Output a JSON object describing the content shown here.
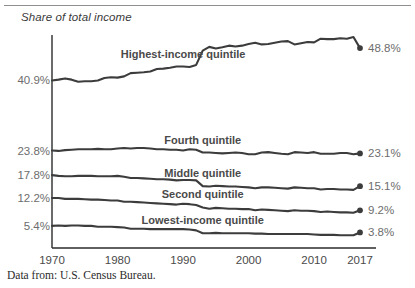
{
  "figure": {
    "axis_title": "Share of total income",
    "source_note": "Data from: U.S. Census Bureau."
  },
  "chart_data": {
    "type": "line",
    "title": "Share of total income",
    "xlabel": "",
    "ylabel": "Share of total income",
    "xlim": [
      1970,
      2017
    ],
    "ylim": [
      0,
      52
    ],
    "grid": false,
    "legend": "inline-labels",
    "xticks": [
      1970,
      1980,
      1990,
      2000,
      2010,
      2017
    ],
    "xticklabels": [
      "1970",
      "1980",
      "1990",
      "2000",
      "2010",
      "2017"
    ],
    "start_labels": [
      "40.9%",
      "23.8%",
      "17.8%",
      "12.2%",
      "5.4%"
    ],
    "end_labels": [
      "48.8%",
      "23.1%",
      "15.1%",
      "9.2%",
      "3.8%"
    ],
    "line_color": "#3c3c3c",
    "x": [
      1970,
      1971,
      1972,
      1973,
      1974,
      1975,
      1976,
      1977,
      1978,
      1979,
      1980,
      1981,
      1982,
      1983,
      1984,
      1985,
      1986,
      1987,
      1988,
      1989,
      1990,
      1991,
      1992,
      1993,
      1994,
      1995,
      1996,
      1997,
      1998,
      1999,
      2000,
      2001,
      2002,
      2003,
      2004,
      2005,
      2006,
      2007,
      2008,
      2009,
      2010,
      2011,
      2012,
      2013,
      2014,
      2015,
      2016,
      2017
    ],
    "series": [
      {
        "name": "Highest-income quintile",
        "start_value": 40.9,
        "end_value": 48.8,
        "label_x": 1990,
        "values": [
          40.9,
          41.1,
          41.4,
          41.1,
          40.6,
          40.7,
          40.7,
          40.9,
          41.5,
          41.7,
          41.6,
          41.9,
          42.7,
          42.8,
          42.9,
          43.1,
          43.7,
          43.8,
          44.0,
          44.3,
          44.3,
          44.2,
          44.7,
          48.2,
          49.1,
          48.7,
          49.0,
          49.4,
          49.2,
          49.4,
          49.8,
          50.1,
          49.7,
          49.8,
          50.1,
          50.4,
          50.5,
          49.7,
          50.0,
          50.3,
          50.2,
          51.1,
          51.0,
          51.0,
          51.2,
          51.1,
          51.5,
          48.8
        ]
      },
      {
        "name": "Fourth quintile",
        "start_value": 23.8,
        "end_value": 23.1,
        "label_x": 1993,
        "values": [
          23.8,
          23.7,
          23.9,
          24.0,
          24.1,
          24.1,
          24.1,
          24.2,
          24.1,
          24.1,
          24.3,
          24.4,
          24.3,
          24.4,
          24.4,
          24.3,
          24.1,
          24.1,
          24.0,
          24.0,
          23.8,
          24.1,
          24.0,
          23.3,
          23.3,
          23.2,
          23.1,
          23.2,
          23.3,
          23.2,
          22.9,
          22.9,
          23.3,
          23.4,
          23.2,
          23.0,
          22.9,
          23.4,
          23.3,
          23.2,
          23.4,
          23.0,
          23.0,
          23.0,
          23.2,
          23.2,
          22.9,
          23.1
        ]
      },
      {
        "name": "Middle quintile",
        "start_value": 17.8,
        "end_value": 15.1,
        "label_x": 1993,
        "values": [
          17.8,
          17.6,
          17.5,
          17.5,
          17.6,
          17.6,
          17.6,
          17.5,
          17.5,
          17.5,
          17.6,
          17.4,
          17.1,
          17.1,
          17.0,
          16.9,
          16.8,
          16.8,
          16.7,
          16.5,
          16.6,
          16.6,
          16.5,
          15.1,
          15.0,
          15.2,
          15.1,
          15.0,
          15.0,
          14.9,
          14.8,
          14.6,
          14.8,
          14.8,
          14.7,
          14.6,
          14.5,
          14.8,
          14.7,
          14.6,
          14.6,
          14.3,
          14.4,
          14.4,
          14.3,
          14.3,
          14.2,
          15.1
        ]
      },
      {
        "name": "Second quintile",
        "start_value": 12.2,
        "end_value": 9.2,
        "label_x": 1993,
        "values": [
          12.2,
          12.2,
          12.0,
          12.0,
          12.0,
          11.9,
          11.8,
          11.8,
          11.7,
          11.6,
          11.6,
          11.3,
          11.3,
          11.2,
          11.1,
          11.0,
          10.9,
          10.8,
          10.7,
          10.6,
          10.8,
          10.7,
          10.5,
          9.9,
          9.6,
          9.8,
          9.7,
          9.6,
          9.6,
          9.5,
          9.5,
          9.2,
          9.4,
          9.3,
          9.2,
          9.1,
          9.0,
          9.2,
          9.1,
          9.1,
          9.0,
          8.8,
          8.9,
          8.8,
          8.7,
          8.7,
          8.6,
          9.2
        ]
      },
      {
        "name": "Lowest-income quintile",
        "start_value": 5.4,
        "end_value": 3.8,
        "label_x": 1993,
        "values": [
          5.4,
          5.5,
          5.4,
          5.5,
          5.5,
          5.4,
          5.4,
          5.2,
          5.2,
          5.2,
          5.1,
          5.0,
          4.7,
          4.7,
          4.7,
          4.6,
          4.6,
          4.6,
          4.6,
          4.6,
          4.6,
          4.5,
          4.3,
          3.6,
          3.6,
          3.7,
          3.6,
          3.6,
          3.6,
          3.6,
          3.6,
          3.5,
          3.5,
          3.4,
          3.4,
          3.4,
          3.4,
          3.4,
          3.4,
          3.4,
          3.3,
          3.2,
          3.2,
          3.2,
          3.1,
          3.1,
          3.1,
          3.8
        ]
      }
    ]
  }
}
